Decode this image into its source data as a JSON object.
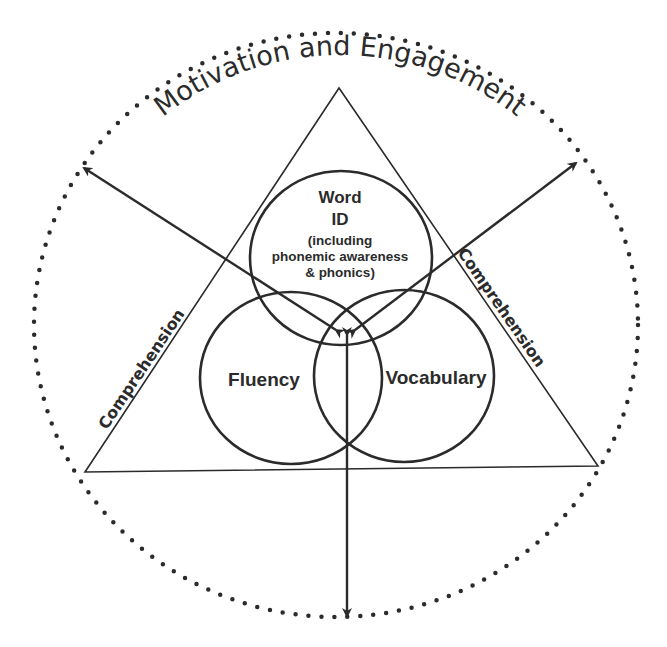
{
  "diagram": {
    "outer_ring_label": "Motivation and Engagement",
    "triangle_left_label": "Comprehension",
    "triangle_right_label": "Comprehension",
    "circles": {
      "top": {
        "line1": "Word",
        "line2": "ID",
        "line3": "(including",
        "line4": "phonemic awareness",
        "line5": "& phonics)"
      },
      "left": {
        "label": "Fluency"
      },
      "right": {
        "label": "Vocabulary"
      }
    },
    "colors": {
      "stroke": "#2b2b2b",
      "background": "#ffffff"
    }
  }
}
